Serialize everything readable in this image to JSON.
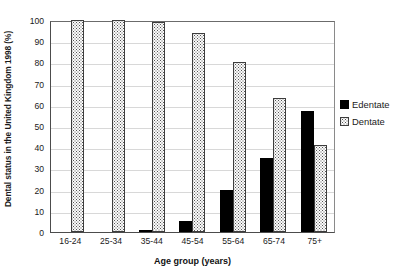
{
  "chart_data": {
    "type": "bar",
    "title": "",
    "subtitle": "",
    "xlabel": "Age group (years)",
    "ylabel": "Dental status in the United Kingdom 1998 (%)",
    "categories": [
      "16-24",
      "25-34",
      "35-44",
      "45-54",
      "55-64",
      "65-74",
      "75+"
    ],
    "series": [
      {
        "name": "Edentate",
        "color": "#000000",
        "pattern": "solid",
        "values": [
          0,
          0,
          1,
          5,
          20,
          35,
          57
        ]
      },
      {
        "name": "Dentate",
        "color": "#fbfbfb",
        "pattern": "dotted",
        "values": [
          100,
          100,
          99,
          94,
          80,
          63,
          41
        ]
      }
    ],
    "ylim": [
      0,
      100
    ],
    "ytick_labels": [
      "100",
      "90",
      "80",
      "70",
      "60",
      "50",
      "40",
      "30",
      "20",
      "10",
      "0"
    ],
    "ytick_values": [
      100,
      90,
      80,
      70,
      60,
      50,
      40,
      30,
      20,
      10,
      0
    ],
    "grid": true,
    "grid_axis": "y",
    "legend_position": "right",
    "legend_entries": [
      "Edentate",
      "Dentate"
    ],
    "annotations": []
  },
  "legend": {
    "items": [
      {
        "label": "Edentate"
      },
      {
        "label": "Dentate"
      }
    ]
  }
}
